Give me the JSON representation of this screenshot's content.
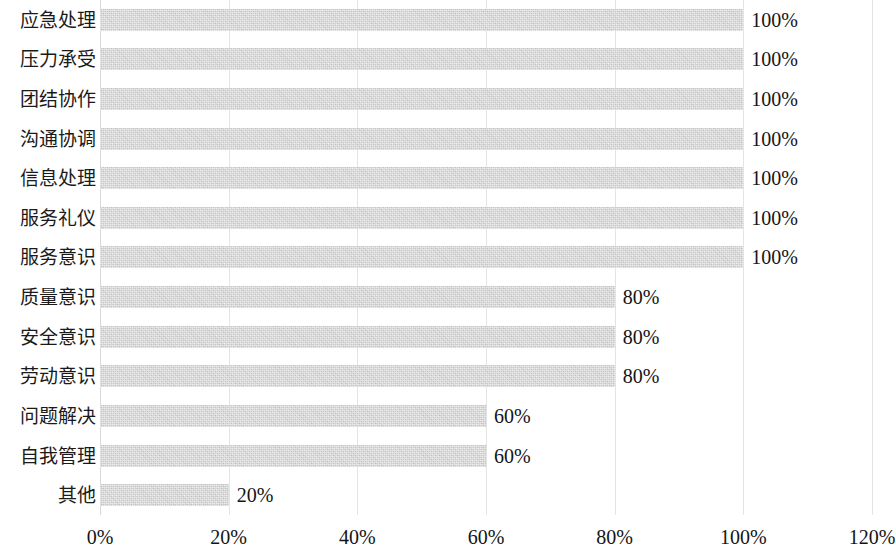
{
  "chart_data": {
    "type": "bar",
    "orientation": "horizontal",
    "title": "",
    "subtitle": "",
    "xlabel": "",
    "ylabel": "",
    "xlim": [
      0,
      120
    ],
    "grid": true,
    "legend": null,
    "legend_position": "none",
    "bar_color": "#d2d2d2",
    "gridline_color": "#e4e4e4",
    "text_color": "#141414",
    "x_ticks": [
      "0%",
      "20%",
      "40%",
      "60%",
      "80%",
      "100%",
      "120%"
    ],
    "x_tick_values": [
      0,
      20,
      40,
      60,
      80,
      100,
      120
    ],
    "categories": [
      "应急处理",
      "压力承受",
      "团结协作",
      "沟通协调",
      "信息处理",
      "服务礼仪",
      "服务意识",
      "质量意识",
      "安全意识",
      "劳动意识",
      "问题解决",
      "自我管理",
      "其他"
    ],
    "values": [
      100,
      100,
      100,
      100,
      100,
      100,
      100,
      80,
      80,
      80,
      60,
      60,
      20
    ],
    "data_labels": [
      "100%",
      "100%",
      "100%",
      "100%",
      "100%",
      "100%",
      "100%",
      "80%",
      "80%",
      "80%",
      "60%",
      "60%",
      "20%"
    ]
  }
}
